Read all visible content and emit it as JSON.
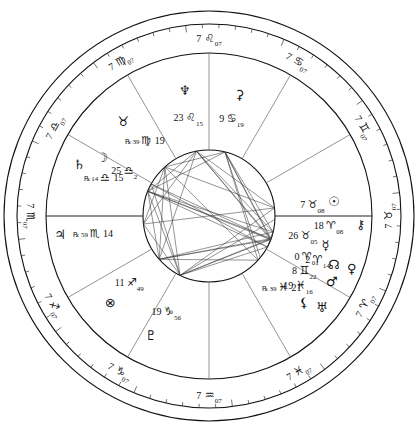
{
  "chart": {
    "type": "natal-wheel",
    "rings": {
      "outer_radius": 205,
      "zodiac_outer": 192,
      "zodiac_inner": 163,
      "house_inner": 66,
      "aspect_circle": 66
    },
    "house_cusps": [
      {
        "house": 1,
        "label_deg": "7",
        "sign_glyph": "♉",
        "sign_name": "taurus",
        "minutes": "07",
        "angle": 180
      },
      {
        "house": 2,
        "label_deg": "7",
        "sign_glyph": "♊",
        "sign_name": "gemini",
        "minutes": "07",
        "angle": 210
      },
      {
        "house": 3,
        "label_deg": "7",
        "sign_glyph": "♋",
        "sign_name": "cancer",
        "minutes": "07",
        "angle": 240
      },
      {
        "house": 4,
        "label_deg": "7",
        "sign_glyph": "♌",
        "sign_name": "leo",
        "minutes": "07",
        "angle": 270
      },
      {
        "house": 5,
        "label_deg": "7",
        "sign_glyph": "♍",
        "sign_name": "virgo",
        "minutes": "07",
        "angle": 300
      },
      {
        "house": 6,
        "label_deg": "7",
        "sign_glyph": "♎",
        "sign_name": "libra",
        "minutes": "07",
        "angle": 330
      },
      {
        "house": 7,
        "label_deg": "7",
        "sign_glyph": "♏",
        "sign_name": "scorpio",
        "minutes": "07",
        "angle": 0
      },
      {
        "house": 8,
        "label_deg": "7",
        "sign_glyph": "♐",
        "sign_name": "sagittarius",
        "minutes": "07",
        "angle": 30
      },
      {
        "house": 9,
        "label_deg": "7",
        "sign_glyph": "♑",
        "sign_name": "capricorn",
        "minutes": "07",
        "angle": 60
      },
      {
        "house": 10,
        "label_deg": "7",
        "sign_glyph": "♒",
        "sign_name": "aquarius",
        "minutes": "07",
        "angle": 90
      },
      {
        "house": 11,
        "label_deg": "7",
        "sign_glyph": "♓",
        "sign_name": "pisces",
        "minutes": "07",
        "angle": 120
      },
      {
        "house": 12,
        "label_deg": "7",
        "sign_glyph": "♈",
        "sign_name": "aries",
        "minutes": "07",
        "angle": 150
      }
    ],
    "planets": [
      {
        "name": "sun",
        "glyph": "☉",
        "deg": "7",
        "sign_glyph": "♉",
        "sign_name": "taurus",
        "min": "08",
        "retrograde": false
      },
      {
        "name": "mercury",
        "glyph": "☿",
        "deg": "26",
        "sign_glyph": "♉",
        "sign_name": "taurus",
        "min": "05",
        "retrograde": false
      },
      {
        "name": "mars",
        "glyph": "♂",
        "deg": "8",
        "sign_glyph": "♊",
        "sign_name": "gemini",
        "min": "22",
        "retrograde": false
      },
      {
        "name": "chiron",
        "glyph": "⚷",
        "deg": "18",
        "sign_glyph": "♈",
        "sign_name": "aries",
        "min": "08",
        "retrograde": false
      },
      {
        "name": "venus",
        "glyph": "♀",
        "deg": "2",
        "sign_glyph": "♈",
        "sign_name": "aries",
        "min": "14",
        "retrograde": false
      },
      {
        "name": "north-node",
        "glyph": "☊",
        "deg": "0",
        "sign_glyph": "♈",
        "sign_name": "aries",
        "min": "01",
        "retrograde": false
      },
      {
        "name": "uranus",
        "glyph": "♅",
        "deg": "19",
        "sign_glyph": "♓",
        "sign_name": "pisces",
        "min": "16",
        "retrograde": false
      },
      {
        "name": "lilith",
        "glyph": "⚸",
        "deg": "21",
        "sign_glyph": "♓",
        "sign_name": "pisces",
        "min": "39",
        "retrograde": true
      },
      {
        "name": "pluto",
        "glyph": "♇",
        "deg": "19",
        "sign_glyph": "♑",
        "sign_name": "capricorn",
        "min": "56",
        "retrograde": false
      },
      {
        "name": "part-of-fortune",
        "glyph": "⊗",
        "deg": "11",
        "sign_glyph": "♐",
        "sign_name": "sagittarius",
        "min": "49",
        "retrograde": false
      },
      {
        "name": "jupiter",
        "glyph": "♃",
        "deg": "14",
        "sign_glyph": "♏",
        "sign_name": "scorpio",
        "min": "59",
        "retrograde": true
      },
      {
        "name": "saturn",
        "glyph": "♄",
        "deg": "15",
        "sign_glyph": "♎",
        "sign_name": "libra",
        "min": "14",
        "retrograde": true
      },
      {
        "name": "moon",
        "glyph": "☽",
        "deg": "25",
        "sign_glyph": "♎",
        "sign_name": "libra",
        "min": "2",
        "retrograde": false
      },
      {
        "name": "south-node",
        "glyph": "♉",
        "deg": "19",
        "sign_glyph": "♍",
        "sign_name": "virgo",
        "min": "39",
        "retrograde": true
      },
      {
        "name": "neptune",
        "glyph": "♆",
        "deg": "23",
        "sign_glyph": "♌",
        "sign_name": "leo",
        "min": "15",
        "retrograde": false
      },
      {
        "name": "ceres",
        "glyph": "⚳",
        "deg": "9",
        "sign_glyph": "♋",
        "sign_name": "cancer",
        "min": "19",
        "retrograde": false
      }
    ],
    "colors": {
      "line": "#1a1a1a",
      "ring": "#000000",
      "aspect": "#444444",
      "background": "#ffffff"
    }
  }
}
